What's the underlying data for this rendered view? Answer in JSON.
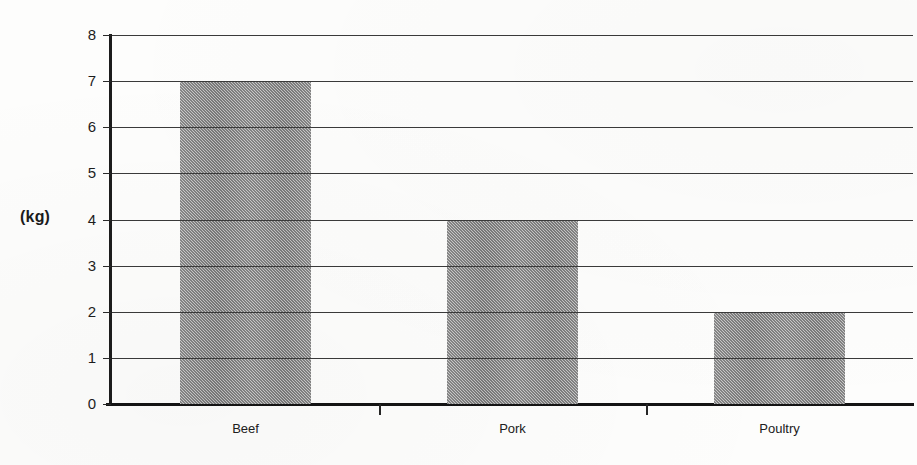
{
  "chart_data": {
    "type": "bar",
    "title": "",
    "xlabel": "",
    "ylabel": "(kg)",
    "categories": [
      "Beef",
      "Pork",
      "Poultry"
    ],
    "values": [
      7,
      4,
      2
    ],
    "series": [
      {
        "name": "Meat consumption",
        "values": [
          7,
          4,
          2
        ]
      }
    ],
    "ylim": [
      0,
      8
    ],
    "y_ticks": [
      0,
      1,
      2,
      3,
      4,
      5,
      6,
      7,
      8
    ],
    "y_tick_labels": [
      "0",
      "1",
      "2",
      "3",
      "4",
      "5",
      "6",
      "7",
      "8"
    ],
    "grid": "horizontal",
    "legend": "none",
    "bar_fill_color": "#a9a9a9",
    "axis_color": "#1c1c1c",
    "background_color": "#fdfdfc"
  },
  "axis": {
    "unit_label": "(kg)"
  }
}
